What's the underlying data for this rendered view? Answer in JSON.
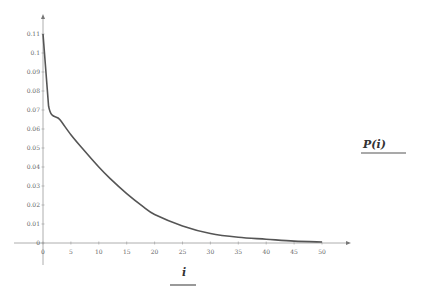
{
  "chart_data": {
    "type": "line",
    "title": "",
    "xlabel": "i",
    "ylabel": "P(i)",
    "xlim": [
      0,
      50
    ],
    "ylim": [
      0,
      0.11
    ],
    "grid": false,
    "x_ticks": [
      0,
      5,
      10,
      15,
      20,
      25,
      30,
      35,
      40,
      45,
      50
    ],
    "y_ticks": [
      0,
      0.01,
      0.02,
      0.03,
      0.04,
      0.05,
      0.06,
      0.07,
      0.08,
      0.09,
      0.1,
      0.11
    ],
    "y_tick_labels": [
      "0",
      "0.01",
      "0.02",
      "0.03",
      "0.04",
      "0.05",
      "0.06",
      "0.07",
      "0.08",
      "0.09",
      "0.1",
      "0.11"
    ],
    "series": [
      {
        "name": "P(i)",
        "color": "#555555",
        "x": [
          0,
          1,
          3,
          5,
          7,
          10,
          12,
          15,
          18,
          20,
          25,
          30,
          35,
          40,
          45,
          50
        ],
        "y": [
          0.11,
          0.072,
          0.065,
          0.057,
          0.05,
          0.04,
          0.034,
          0.026,
          0.019,
          0.015,
          0.009,
          0.005,
          0.003,
          0.002,
          0.001,
          0.0005
        ]
      }
    ]
  },
  "labels": {
    "x_axis": "i",
    "y_axis": "P(i)"
  }
}
